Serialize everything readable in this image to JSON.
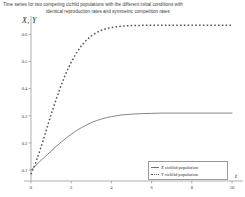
{
  "caption": {
    "line1": "Time series for two competing cichlid populations with the different initial conditions with",
    "line2": "identical reproduction rates and symmetric competition rates"
  },
  "chart_data": {
    "type": "line",
    "title": "Time series for two competing cichlid populations with the different initial conditions with identical reproduction rates and symmetric competition rates",
    "xlabel": "t",
    "ylabel": "X, Y",
    "xlim": [
      0,
      10
    ],
    "ylim": [
      0.06,
      0.66
    ],
    "xticks": [
      "0",
      "2",
      "4",
      "6",
      "8",
      "10"
    ],
    "xtick_values": [
      0,
      2,
      4,
      6,
      8,
      10
    ],
    "yticks": [
      "0.1",
      "0.2",
      "0.3",
      "0.4",
      "0.5",
      "0.6"
    ],
    "ytick_values": [
      0.1,
      0.2,
      0.3,
      0.4,
      0.5,
      0.6
    ],
    "grid": false,
    "legend_position": "lower-right",
    "x": [
      0,
      0.25,
      0.5,
      0.75,
      1,
      1.25,
      1.5,
      1.75,
      2,
      2.25,
      2.5,
      2.75,
      3,
      3.25,
      3.5,
      3.75,
      4,
      4.5,
      5,
      5.5,
      6,
      6.5,
      7,
      7.5,
      8,
      8.5,
      9,
      9.5,
      10
    ],
    "series": [
      {
        "name": "X cichlid population",
        "symbol": "X",
        "label_rest": " cichlid population",
        "style": "solid",
        "color": "#6f6f6f",
        "values": [
          0.1,
          0.118,
          0.136,
          0.153,
          0.17,
          0.187,
          0.203,
          0.218,
          0.232,
          0.245,
          0.256,
          0.266,
          0.275,
          0.282,
          0.288,
          0.293,
          0.297,
          0.303,
          0.306,
          0.308,
          0.309,
          0.31,
          0.31,
          0.31,
          0.31,
          0.31,
          0.31,
          0.31,
          0.31
        ]
      },
      {
        "name": "Y cichlid population",
        "symbol": "Y",
        "label_rest": " cichlid population",
        "style": "dotted",
        "color": "#585858",
        "values": [
          0.085,
          0.13,
          0.185,
          0.245,
          0.305,
          0.36,
          0.412,
          0.458,
          0.497,
          0.53,
          0.557,
          0.578,
          0.594,
          0.606,
          0.615,
          0.621,
          0.625,
          0.63,
          0.632,
          0.633,
          0.633,
          0.633,
          0.633,
          0.633,
          0.633,
          0.633,
          0.633,
          0.633,
          0.633
        ]
      }
    ]
  }
}
